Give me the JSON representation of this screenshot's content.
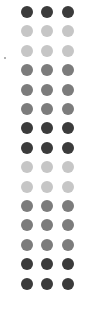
{
  "layout": {
    "columns_x": [
      27,
      47,
      68
    ],
    "first_row_y": 12,
    "row_spacing": 19.4,
    "dot_diameter": 12
  },
  "shades": {
    "dark": "#3b3b3b",
    "mid": "#7c7c7c",
    "light": "#c6c6c6"
  },
  "rows": [
    {
      "shade": "dark"
    },
    {
      "shade": "light"
    },
    {
      "shade": "light"
    },
    {
      "shade": "mid"
    },
    {
      "shade": "mid"
    },
    {
      "shade": "mid"
    },
    {
      "shade": "dark"
    },
    {
      "shade": "dark"
    },
    {
      "shade": "light"
    },
    {
      "shade": "light"
    },
    {
      "shade": "mid"
    },
    {
      "shade": "mid"
    },
    {
      "shade": "mid"
    },
    {
      "shade": "dark"
    },
    {
      "shade": "dark"
    }
  ]
}
